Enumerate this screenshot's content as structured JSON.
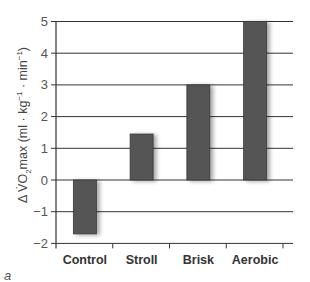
{
  "chart_data": {
    "type": "bar",
    "title": "",
    "categories": [
      "Control",
      "Stroll",
      "Brisk",
      "Aerobic"
    ],
    "values": [
      -1.7,
      1.45,
      3.0,
      5.0
    ],
    "xlabel": "",
    "ylabel": "Δ V̇O₂max (ml · kg⁻¹ · min⁻¹)",
    "ylim": [
      -2,
      5
    ],
    "yticks": [
      -2,
      -1,
      0,
      1,
      2,
      3,
      4,
      5
    ],
    "ytick_labels": [
      "−2",
      "−1",
      "0",
      "1",
      "2",
      "3",
      "4",
      "5"
    ],
    "grid": true,
    "legend": null,
    "bar_color": "#555555",
    "grid_color": "#333333",
    "panel_label": "a"
  },
  "labels": {
    "ylabel_prefix": "Δ V̇O",
    "ylabel_sub": "2",
    "ylabel_mid": "max (ml · kg",
    "ylabel_sup1": "−1",
    "ylabel_mid2": " · min",
    "ylabel_sup2": "−1",
    "ylabel_end": ")",
    "panel_letter": "a"
  }
}
